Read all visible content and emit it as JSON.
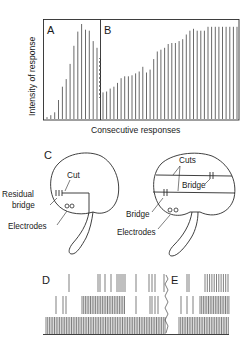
{
  "figure": {
    "panels": {
      "A": "A",
      "B": "B",
      "C": "C",
      "D": "D",
      "E": "E"
    },
    "colors": {
      "ink": "#2a2a2a",
      "background": "#ffffff"
    }
  },
  "chart_data": {
    "type": "bar",
    "title": "",
    "xlabel": "Consecutive responses",
    "ylabel": "Intensity of response",
    "ylim": [
      0,
      100
    ],
    "grid": false,
    "legend": null,
    "segments": [
      {
        "name": "A",
        "values": [
          2,
          4,
          7,
          20,
          34,
          42,
          58,
          77,
          92,
          100,
          94,
          93,
          82,
          75
        ]
      },
      {
        "name": "B",
        "values": [
          28,
          29,
          32,
          34,
          38,
          43,
          45,
          45,
          46,
          48,
          50,
          55,
          49,
          52,
          63,
          71,
          73,
          75,
          79,
          80,
          80,
          82,
          84,
          89,
          93,
          95,
          93,
          93,
          93,
          97,
          97,
          97,
          97,
          97,
          97,
          97,
          97,
          97
        ]
      }
    ],
    "divider_after_index": 13,
    "annotations": [
      "dashed zig-zag transition line between A and B"
    ]
  },
  "diagram_c": {
    "left_brain": {
      "labels": {
        "cut": "Cut",
        "residual": "Residual",
        "bridge": "bridge",
        "electrodes": "Electrodes"
      }
    },
    "right_brain": {
      "labels": {
        "cuts": "Cuts",
        "bridge_upper": "Bridge",
        "bridge_lower": "Bridge",
        "electrodes": "Electrodes"
      }
    }
  },
  "traces": {
    "D": {
      "rows": 3
    },
    "E": {
      "rows": 3
    }
  }
}
